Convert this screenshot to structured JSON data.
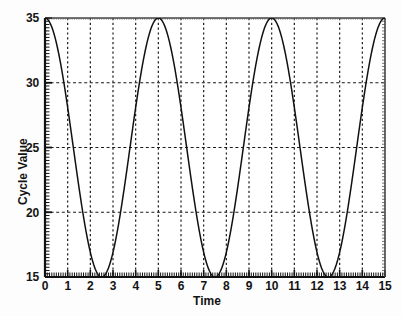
{
  "chart_data": {
    "type": "line",
    "title": "",
    "subtitle": "",
    "xlabel": "Time",
    "ylabel": "Cycle Value",
    "xlim": [
      0,
      15
    ],
    "ylim": [
      15,
      35
    ],
    "xticks": [
      "0",
      "1",
      "2",
      "3",
      "4",
      "5",
      "6",
      "7",
      "8",
      "9",
      "10",
      "11",
      "12",
      "13",
      "14",
      "15"
    ],
    "xtick_values": [
      0,
      1,
      2,
      3,
      4,
      5,
      6,
      7,
      8,
      9,
      10,
      11,
      12,
      13,
      14,
      15
    ],
    "yticks": [
      "15",
      "20",
      "25",
      "30",
      "35"
    ],
    "ytick_values": [
      15,
      20,
      25,
      30,
      35
    ],
    "grid": true,
    "grid_style": "dotted",
    "grid_x_at": [
      1,
      2,
      3,
      4,
      5,
      6,
      7,
      8,
      9,
      10,
      11,
      12,
      13,
      14
    ],
    "grid_y_at": [
      20,
      25,
      30
    ],
    "legend": "none",
    "minor_ticks": true,
    "line_color": "#111111",
    "series": [
      {
        "name": "Cycle Value",
        "formula": "25 + 10*cos(2*pi*t/5)",
        "period": 5,
        "amplitude": 10,
        "midline": 25,
        "peaks_at": [
          0,
          5,
          10,
          15
        ],
        "peak_value": 35,
        "troughs_at": [
          2.5,
          7.5,
          12.5
        ],
        "trough_value": 15,
        "x": [
          0,
          0.25,
          0.5,
          0.75,
          1,
          1.25,
          1.5,
          1.75,
          2,
          2.25,
          2.5,
          2.75,
          3,
          3.25,
          3.5,
          3.75,
          4,
          4.25,
          4.5,
          4.75,
          5,
          5.25,
          5.5,
          5.75,
          6,
          6.25,
          6.5,
          6.75,
          7,
          7.25,
          7.5,
          7.75,
          8,
          8.25,
          8.5,
          8.75,
          9,
          9.25,
          9.5,
          9.75,
          10,
          10.25,
          10.5,
          10.75,
          11,
          11.25,
          11.5,
          11.75,
          12,
          12.25,
          12.5,
          12.75,
          13,
          13.25,
          13.5,
          13.75,
          14,
          14.25,
          14.5,
          14.75,
          15
        ],
        "y": [
          35,
          34.05,
          31.41,
          27.5,
          22.94,
          18.59,
          15.95,
          15.95,
          18.59,
          22.94,
          27.5,
          31.41,
          34.05,
          35,
          34.05,
          31.41,
          27.5,
          22.94,
          18.59,
          15.95,
          15.95,
          18.59,
          22.94,
          27.5,
          31.41,
          34.05,
          35,
          34.05,
          31.41,
          27.5,
          22.94,
          18.59,
          15.95,
          15.95,
          18.59,
          22.94,
          27.5,
          31.41,
          34.05,
          35,
          34.05,
          31.41,
          27.5,
          22.94,
          18.59,
          15.95,
          15.95,
          18.59,
          22.94,
          27.5,
          31.41,
          34.05,
          35,
          34.05,
          31.41,
          27.5,
          22.94,
          18.59,
          15.95,
          15.95,
          18.59
        ]
      }
    ]
  },
  "axes": {
    "x_axis_name": "Time",
    "y_axis_name": "Cycle Value"
  }
}
